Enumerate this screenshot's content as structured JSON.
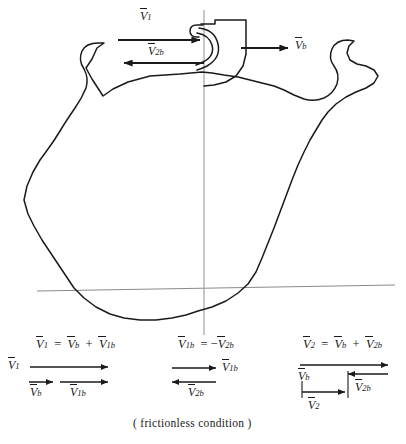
{
  "figure": {
    "caption": "( frictionless condition )",
    "background_color": "#ffffff",
    "ink_color": "#1a1a1a",
    "axis_color": "#808080"
  },
  "main_diagram": {
    "name": "deformable-body-impact-diagram",
    "vectors": [
      {
        "id": "v1",
        "label_base": "V",
        "label_sub": "1",
        "direction": "right",
        "x1": 118,
        "y1": 40,
        "x2": 204,
        "y2": 40,
        "label_x": 146,
        "label_y": 12
      },
      {
        "id": "v2b",
        "label_base": "V",
        "label_sub": "2b",
        "direction": "left",
        "x1": 204,
        "y1": 63,
        "x2": 120,
        "y2": 63,
        "label_x": 152,
        "label_y": 44
      },
      {
        "id": "vb",
        "label_base": "V",
        "label_sub": "b",
        "direction": "right",
        "x1": 241,
        "y1": 48,
        "x2": 292,
        "y2": 48,
        "label_x": 297,
        "label_y": 39
      }
    ],
    "axes": {
      "horizontal": {
        "x1": 37,
        "y1": 291,
        "x2": 395,
        "y2": 285
      },
      "vertical": {
        "x1": 204,
        "y1": 10,
        "x2": 204,
        "y2": 335
      }
    }
  },
  "equations": [
    {
      "id": "eq-1",
      "lhs_base": "V",
      "lhs_sub": "1",
      "text": "V1 = Vb + V1b",
      "terms": [
        {
          "base": "V",
          "sub": "1"
        },
        {
          "base": "V",
          "sub": "b"
        },
        {
          "base": "V",
          "sub": "1b"
        }
      ],
      "resultant_label_base": "V",
      "resultant_label_sub": "1",
      "component_labels": [
        {
          "base": "V",
          "sub": "b"
        },
        {
          "base": "V",
          "sub": "1b"
        }
      ]
    },
    {
      "id": "eq-2",
      "lhs_base": "V",
      "lhs_sub": "1b",
      "text": "V1b = -V2b",
      "terms": [
        {
          "base": "V",
          "sub": "1b"
        },
        {
          "base": "V",
          "sub": "2b"
        }
      ],
      "arrow_labels": [
        {
          "base": "V",
          "sub": "1b",
          "direction": "right"
        },
        {
          "base": "V",
          "sub": "2b",
          "direction": "left"
        }
      ]
    },
    {
      "id": "eq-3",
      "lhs_base": "V",
      "lhs_sub": "2",
      "text": "V2 = Vb + V2b",
      "terms": [
        {
          "base": "V",
          "sub": "2"
        },
        {
          "base": "V",
          "sub": "b"
        },
        {
          "base": "V",
          "sub": "2b"
        }
      ],
      "arrow_labels": [
        {
          "base": "V",
          "sub": "b",
          "direction": "right"
        },
        {
          "base": "V",
          "sub": "2b",
          "direction": "left"
        },
        {
          "base": "V",
          "sub": "2",
          "direction": "right"
        }
      ]
    }
  ]
}
